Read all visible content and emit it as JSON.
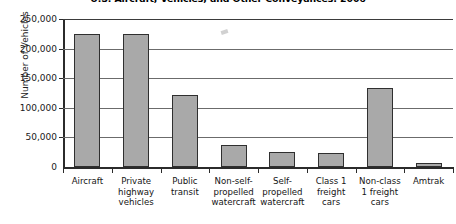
{
  "chart_data": {
    "type": "bar",
    "title": "U.S. Aircraft, Vehicles, and Other Conveyances: 2006",
    "xlabel": "",
    "ylabel": "Number of Vehicles",
    "ylim": [
      0,
      250000
    ],
    "ytick_step": 50000,
    "grid": true,
    "legend": false,
    "categories": [
      "Aircraft",
      "Private\nhighway\nvehicles",
      "Public\ntransit",
      "Non-self-\npropelled\nwatercraft",
      "Self-\npropelled\nwatercraft",
      "Class 1\nfreight\ncars",
      "Non-class\n1 freight\ncars",
      "Amtrak"
    ],
    "values": [
      224600,
      225300,
      121600,
      37000,
      25000,
      24300,
      133400,
      6800
    ],
    "ytick_labels": [
      "250,000",
      "200,000",
      "150,000",
      "100,000",
      "50,000",
      "0"
    ],
    "ytick_values": [
      250000,
      200000,
      150000,
      100000,
      50000,
      0
    ],
    "bar_color": "#a9a9a9",
    "bar_border_color": "#2f2f2f",
    "gridline_color": "#6b6b6b",
    "axis_color": "#2b2b2b",
    "background_color": "#ffffff"
  }
}
